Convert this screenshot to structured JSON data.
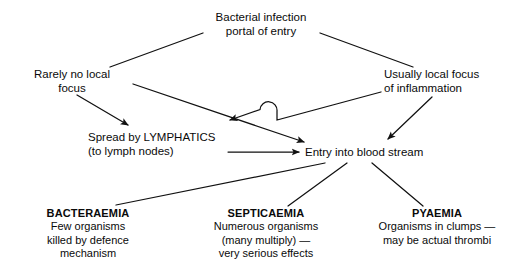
{
  "diagram": {
    "stroke_color": "#111111",
    "background_color": "#ffffff",
    "nodes": {
      "root": {
        "name": "bacterial-infection",
        "line1": "Bacterial infection",
        "line2": "portal of entry"
      },
      "rarely_no_local_focus": {
        "name": "rarely-no-local-focus",
        "line1": "Rarely no local",
        "line2": "focus"
      },
      "usually_local_focus": {
        "name": "usually-local-focus",
        "line1": "Usually local focus",
        "line2": "of inflammation"
      },
      "spread_by_lymphatics": {
        "name": "spread-by-lymphatics",
        "line1": "Spread by LYMPHATICS",
        "line2": "(to lymph nodes)"
      },
      "entry_into_blood_stream": {
        "name": "entry-into-blood-stream",
        "line1": "Entry into blood stream"
      },
      "bacteraemia": {
        "heading": "BACTERAEMIA",
        "line1": "Few organisms",
        "line2": "killed by defence",
        "line3": "mechanism"
      },
      "septicaemia": {
        "heading": "SEPTICAEMIA",
        "line1": "Numerous organisms",
        "line2": "(many multiply) —",
        "line3": "very serious effects"
      },
      "pyaemia": {
        "heading": "PYAEMIA",
        "line1": "Organisms in clumps —",
        "line2": "may be actual thrombi"
      }
    },
    "edges": [
      {
        "name": "root-to-rarely",
        "from": "bacterial-infection",
        "to": "rarely-no-local-focus",
        "arrowhead": false
      },
      {
        "name": "root-to-usually",
        "from": "bacterial-infection",
        "to": "usually-local-focus",
        "arrowhead": false
      },
      {
        "name": "rarely-to-lymphatics",
        "from": "rarely-no-local-focus",
        "to": "spread-by-lymphatics",
        "arrowhead": true
      },
      {
        "name": "rarely-to-blood",
        "from": "rarely-no-local-focus",
        "to": "entry-into-blood-stream",
        "arrowhead": true
      },
      {
        "name": "usually-to-lymphatics",
        "from": "usually-local-focus",
        "to": "spread-by-lymphatics",
        "arrowhead": true,
        "crossing_hop": true
      },
      {
        "name": "usually-to-blood",
        "from": "usually-local-focus",
        "to": "entry-into-blood-stream",
        "arrowhead": true
      },
      {
        "name": "lymphatics-to-blood",
        "from": "spread-by-lymphatics",
        "to": "entry-into-blood-stream",
        "arrowhead": true
      },
      {
        "name": "blood-to-bacteraemia",
        "from": "entry-into-blood-stream",
        "to": "bacteraemia",
        "arrowhead": false
      },
      {
        "name": "blood-to-septicaemia",
        "from": "entry-into-blood-stream",
        "to": "septicaemia",
        "arrowhead": false
      },
      {
        "name": "blood-to-pyaemia",
        "from": "entry-into-blood-stream",
        "to": "pyaemia",
        "arrowhead": false
      }
    ]
  }
}
